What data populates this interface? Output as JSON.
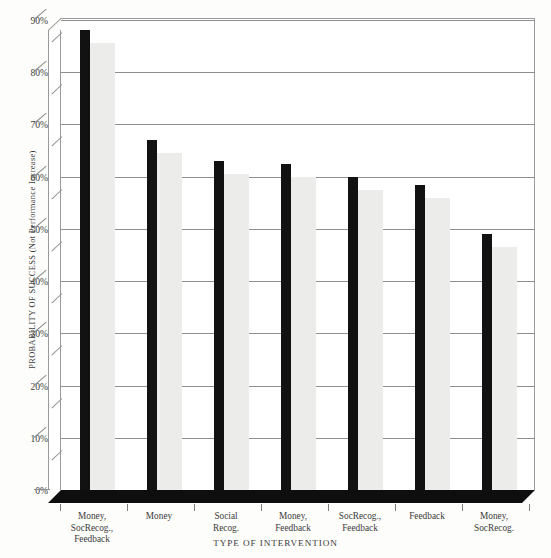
{
  "chart_data": {
    "type": "bar",
    "title": "",
    "xlabel": "TYPE OF INTERVENTION",
    "ylabel": "PROBABILITY OF SUCCESS (Not Performance Increase)",
    "categories": [
      "Money, SocRecog., Feedback",
      "Money",
      "Social Recog.",
      "Money, Feedback",
      "SocRecog., Feedback",
      "Feedback",
      "Money, SocRecog."
    ],
    "category_lines": [
      [
        "Money,",
        "SocRecog.,",
        "Feedback"
      ],
      [
        "Money"
      ],
      [
        "Social",
        "Recog."
      ],
      [
        "Money,",
        "Feedback"
      ],
      [
        "SocRecog.,",
        "Feedback"
      ],
      [
        "Feedback"
      ],
      [
        "Money,",
        "SocRecog."
      ]
    ],
    "values": [
      88,
      67,
      63,
      62.5,
      60,
      58.5,
      49
    ],
    "ylim": [
      0,
      90
    ],
    "ytick_values": [
      0,
      10,
      20,
      30,
      40,
      50,
      60,
      70,
      80,
      90
    ],
    "ytick_labels": [
      "0%",
      "10%",
      "20%",
      "30%",
      "40%",
      "50%",
      "60%",
      "70%",
      "80%",
      "90%"
    ],
    "grid": true,
    "legend": "none",
    "style": "3d-column",
    "bar_front_color": "#121212",
    "bar_side_color": "#ececea",
    "gridline_color": "#8f8f8f",
    "axis_color": "#9a9a9a",
    "background_color": "#fdfdfb",
    "plot_background_color": "#ffffff"
  },
  "top_sliver_text": ""
}
